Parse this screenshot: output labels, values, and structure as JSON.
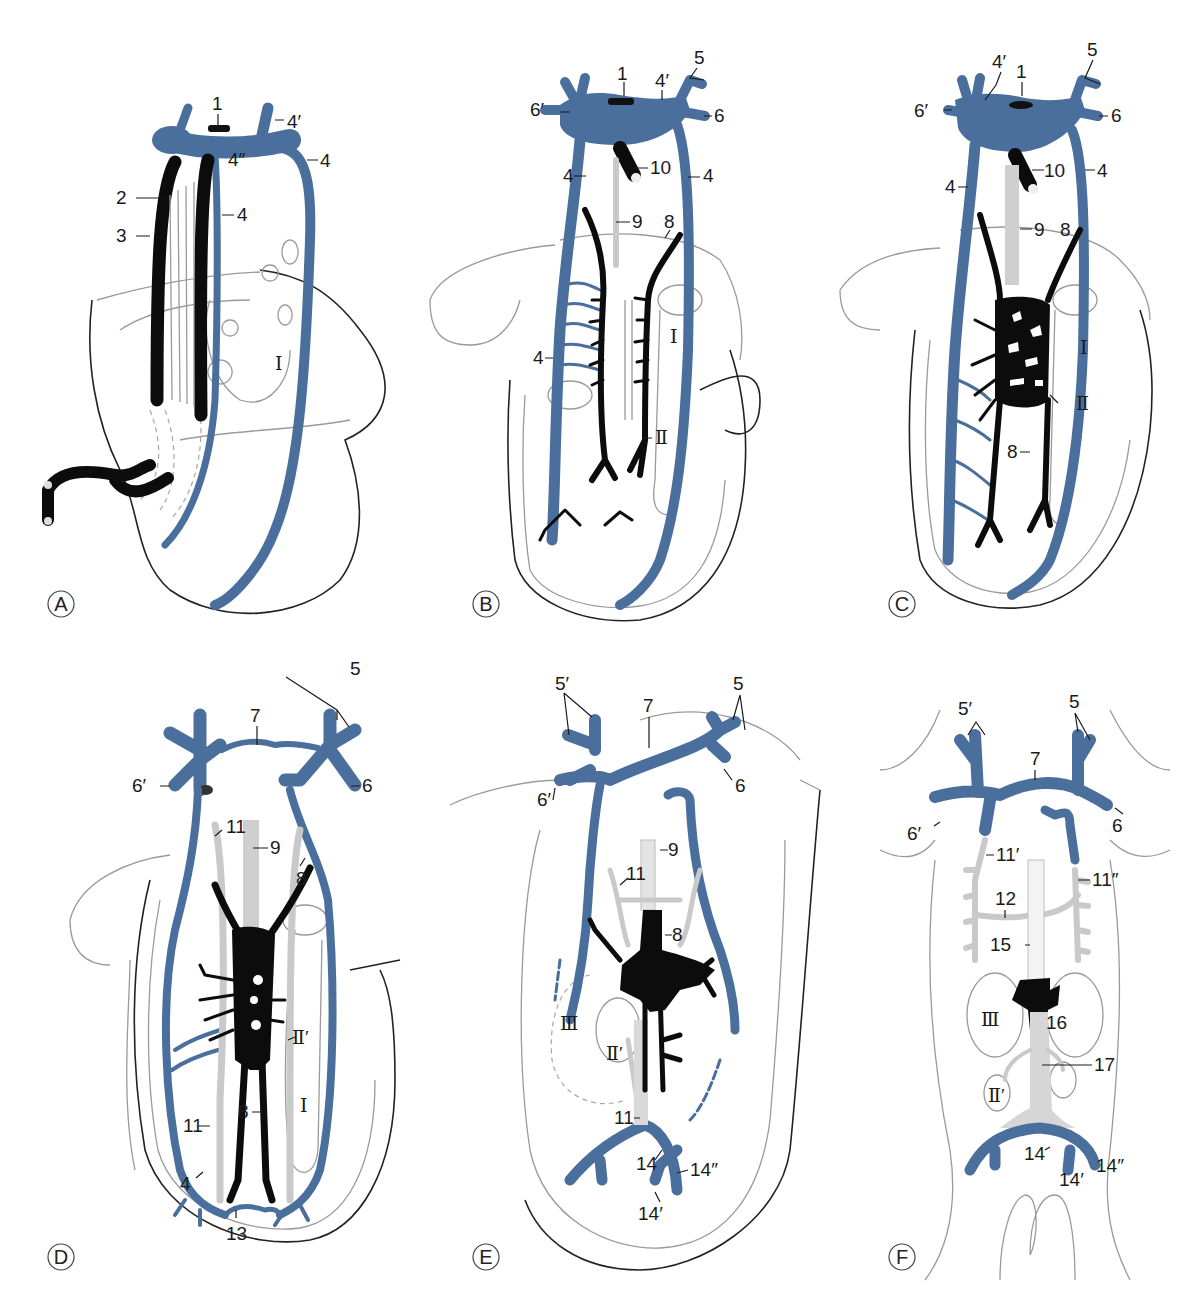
{
  "figure": {
    "colors": {
      "blue_vessel": "#4a6f9c",
      "black_vessel": "#0c0c0c",
      "grey_vessel": "#c9c9c9",
      "outline": "#9a9a9a"
    },
    "panels": [
      {
        "id": "A",
        "labels": [
          "1",
          "2",
          "3",
          "4",
          "4",
          "4′",
          "4″",
          "Ⅰ"
        ]
      },
      {
        "id": "B",
        "labels": [
          "1",
          "4′",
          "5",
          "6",
          "6′",
          "4",
          "4",
          "10",
          "9",
          "8",
          "4",
          "Ⅰ",
          "Ⅱ"
        ]
      },
      {
        "id": "C",
        "labels": [
          "4′",
          "1",
          "5",
          "6′",
          "6",
          "4",
          "10",
          "4",
          "9",
          "8",
          "Ⅰ",
          "Ⅱ",
          "8"
        ]
      },
      {
        "id": "D",
        "labels": [
          "5",
          "7",
          "6′",
          "6",
          "11",
          "9",
          "8",
          "Ⅱ′",
          "Ⅰ",
          "11",
          "8",
          "4",
          "13"
        ]
      },
      {
        "id": "E",
        "labels": [
          "5′",
          "7",
          "5",
          "6′",
          "6",
          "9",
          "11",
          "8",
          "Ⅲ",
          "Ⅱ′",
          "11",
          "14",
          "14″",
          "14′"
        ]
      },
      {
        "id": "F",
        "labels": [
          "5′",
          "5",
          "7",
          "6′",
          "6",
          "11′",
          "11″",
          "12",
          "15",
          "Ⅲ",
          "16",
          "17",
          "Ⅱ′",
          "14",
          "14′",
          "14″"
        ]
      }
    ]
  },
  "text": {
    "A": {
      "letter": "A",
      "l1": "1",
      "l2": "2",
      "l3": "3",
      "l4a": "4",
      "l4b": "4",
      "l4p": "4′",
      "l4pp": "4″",
      "rI": "Ⅰ"
    },
    "B": {
      "letter": "B",
      "l1": "1",
      "l4p": "4′",
      "l5": "5",
      "l6": "6",
      "l6p": "6′",
      "l4a": "4",
      "l4b": "4",
      "l10": "10",
      "l9": "9",
      "l8": "8",
      "l4c": "4",
      "rI": "Ⅰ",
      "rII": "Ⅱ"
    },
    "C": {
      "letter": "C",
      "l4p": "4′",
      "l1": "1",
      "l5": "5",
      "l6p": "6′",
      "l6": "6",
      "l4a": "4",
      "l10": "10",
      "l4b": "4",
      "l9": "9",
      "l8a": "8",
      "rI": "Ⅰ",
      "rII": "Ⅱ",
      "l8b": "8"
    },
    "D": {
      "letter": "D",
      "l5": "5",
      "l7": "7",
      "l6p": "6′",
      "l6": "6",
      "l11a": "11",
      "l9": "9",
      "l8a": "8",
      "rIIp": "Ⅱ′",
      "rI": "Ⅰ",
      "l11b": "11",
      "l8b": "8",
      "l4": "4",
      "l13": "13"
    },
    "E": {
      "letter": "E",
      "l5p": "5′",
      "l7": "7",
      "l5": "5",
      "l6p": "6′",
      "l6": "6",
      "l9": "9",
      "l11a": "11",
      "l8": "8",
      "rIII": "Ⅲ",
      "rIIp": "Ⅱ′",
      "l11b": "11",
      "l14": "14",
      "l14pp": "14″",
      "l14p": "14′"
    },
    "F": {
      "letter": "F",
      "l5p": "5′",
      "l5": "5",
      "l7": "7",
      "l6p": "6′",
      "l6": "6",
      "l11p": "11′",
      "l11pp": "11″",
      "l12": "12",
      "l15": "15",
      "rIII": "Ⅲ",
      "l16": "16",
      "l17": "17",
      "rIIp": "Ⅱ′",
      "l14": "14",
      "l14p": "14′",
      "l14pp": "14″"
    }
  }
}
